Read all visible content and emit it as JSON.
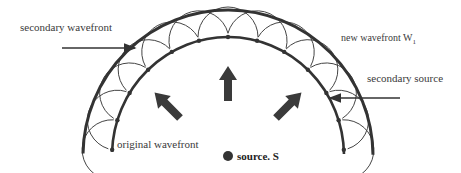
{
  "diagram": {
    "labels": {
      "secondary_wavefront": "secondary wavefront",
      "new_wavefront": "new wavefront W",
      "new_wavefront_subscript": "1",
      "secondary_source": "secondary source",
      "original_wavefront": "original wavefront",
      "source": "source. S"
    },
    "colors": {
      "line": "#333333",
      "arrow": "#3a3a3a",
      "text": "#3a3a3a",
      "background": "#ffffff"
    },
    "geometry": {
      "center": [
        228,
        156
      ],
      "inner_radius": [
        116,
        119
      ],
      "outer_radius": [
        145,
        146
      ],
      "secondary_count": 13
    }
  }
}
